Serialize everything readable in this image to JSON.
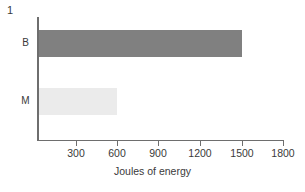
{
  "figure": {
    "number_label": "1"
  },
  "chart_data": {
    "type": "bar",
    "orientation": "horizontal",
    "title": "",
    "subtitle": "",
    "categories": [
      "B",
      "M"
    ],
    "values": [
      1500,
      600
    ],
    "series": [
      {
        "name": "Joules of energy",
        "values": [
          1500,
          600
        ]
      }
    ],
    "bar_colors": [
      "#808080",
      "#ebebeb"
    ],
    "xlabel": "Joules of energy",
    "ylabel": "",
    "xlim": [
      0,
      1800
    ],
    "xticks": [
      300,
      600,
      900,
      1200,
      1500,
      1800
    ],
    "xticklabels": [
      "300",
      "600",
      "900",
      "1200",
      "1500",
      "1800"
    ],
    "yticklabels": [
      "B",
      "M"
    ],
    "grid": false,
    "legend": false,
    "legend_position": "none",
    "axis_color": "#6e6e6e",
    "text_color": "#3a3a3a",
    "background": "#ffffff"
  },
  "axis": {
    "x_title": "Joules of energy",
    "ticks": [
      {
        "value": "300",
        "left": 76
      },
      {
        "value": "600",
        "left": 117
      },
      {
        "value": "900",
        "left": 158
      },
      {
        "value": "1200",
        "left": 200
      },
      {
        "value": "1500",
        "left": 242
      },
      {
        "value": "1800",
        "left": 283
      }
    ]
  },
  "bars": [
    {
      "label": "B",
      "value": 1500,
      "width_px": 203,
      "color": "#808080"
    },
    {
      "label": "M",
      "value": 600,
      "width_px": 78,
      "color": "#ebebeb"
    }
  ]
}
